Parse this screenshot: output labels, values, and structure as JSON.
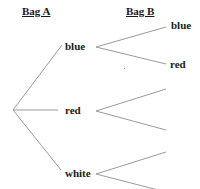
{
  "headers": {
    "bag_a": "Bag A",
    "bag_b": "Bag B"
  },
  "first_stage": {
    "items": [
      {
        "label": "blue"
      },
      {
        "label": "red"
      },
      {
        "label": "white"
      }
    ]
  },
  "second_stage": {
    "blue_branch": {
      "upper": "blue",
      "lower": "red"
    },
    "red_branch": {
      "upper": "",
      "lower": ""
    },
    "white_branch": {
      "upper": "",
      "lower": ""
    }
  },
  "colors": {
    "line": "#9a9a9a",
    "text": "#1a1a1a"
  }
}
